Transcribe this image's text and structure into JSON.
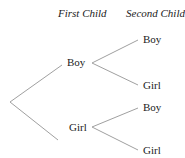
{
  "headers": {
    "first": "First Child",
    "second": "Second Child"
  },
  "tree": {
    "level1": [
      {
        "label": "Boy",
        "children": [
          {
            "label": "Boy"
          },
          {
            "label": "Girl"
          }
        ]
      },
      {
        "label": "Girl",
        "children": [
          {
            "label": "Boy"
          },
          {
            "label": "Girl"
          }
        ]
      }
    ]
  },
  "colors": {
    "line": "#a0a0a0",
    "text": "#222222"
  }
}
